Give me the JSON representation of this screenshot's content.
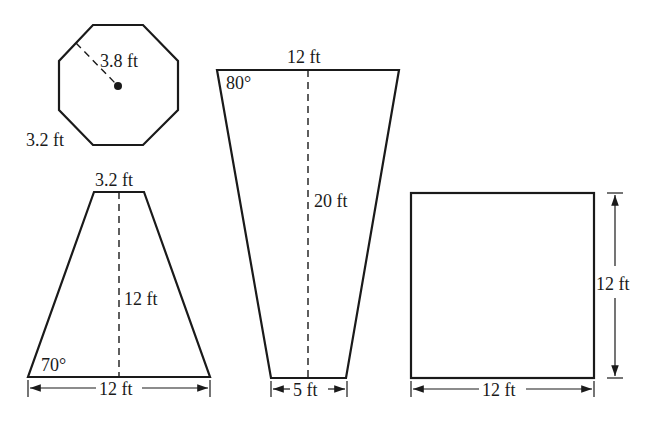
{
  "figures": {
    "octagon": {
      "radius_label": "3.8 ft",
      "side_label": "3.2 ft"
    },
    "trapezoid": {
      "top_label": "3.2 ft",
      "height_label": "12 ft",
      "angle_label": "70°",
      "base_label": "12 ft"
    },
    "inverted_trapezoid": {
      "top_label": "12 ft",
      "angle_label": "80°",
      "height_label": "20 ft",
      "base_label": "5 ft"
    },
    "square": {
      "width_label": "12 ft",
      "height_label": "12 ft"
    }
  },
  "colors": {
    "stroke": "#1a1a1a",
    "background": "#ffffff"
  }
}
